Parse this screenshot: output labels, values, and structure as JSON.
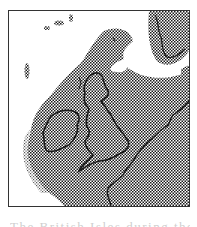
{
  "map": {
    "subject": "British Isles and North Sea region",
    "fill_pattern": "halftone-checker",
    "colors": {
      "ink": "#1a1a1a",
      "paper": "#ffffff",
      "frame": "#333333",
      "caption": "#cfcfcf"
    },
    "features": [
      {
        "name": "ireland",
        "type": "landmass-outline"
      },
      {
        "name": "great-britain",
        "type": "landmass-outline"
      },
      {
        "name": "scandinavia",
        "type": "landmass-outline"
      },
      {
        "name": "continental-coast",
        "type": "coastline"
      },
      {
        "name": "northern-ice-free-channel",
        "type": "white-channel"
      },
      {
        "name": "faroe-shetland-islands",
        "type": "island-dots"
      }
    ]
  },
  "caption": {
    "text": "The British Isles during the Ice Age",
    "truncated": true
  }
}
